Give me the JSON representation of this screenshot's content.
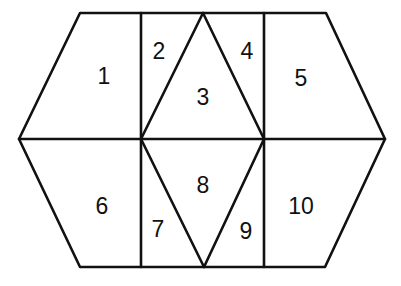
{
  "diagram": {
    "vertices": {
      "top_left": [
        80,
        13
      ],
      "top_v1": [
        141,
        13
      ],
      "top_apex": [
        203,
        13
      ],
      "top_v2": [
        264,
        13
      ],
      "top_right": [
        326,
        13
      ],
      "left": [
        19,
        139
      ],
      "mid_v1": [
        141,
        139
      ],
      "mid_v2": [
        264,
        139
      ],
      "right": [
        385,
        139
      ],
      "bottom_left": [
        80,
        267
      ],
      "bottom_v1": [
        141,
        267
      ],
      "bottom_apex": [
        204,
        267
      ],
      "bottom_v2": [
        264,
        267
      ],
      "bottom_right": [
        325,
        267
      ]
    },
    "regions": [
      {
        "label": "1",
        "x": 104,
        "y": 76
      },
      {
        "label": "2",
        "x": 159,
        "y": 51
      },
      {
        "label": "3",
        "x": 203,
        "y": 97
      },
      {
        "label": "4",
        "x": 247,
        "y": 51
      },
      {
        "label": "5",
        "x": 301,
        "y": 78
      },
      {
        "label": "6",
        "x": 102,
        "y": 206
      },
      {
        "label": "7",
        "x": 158,
        "y": 229
      },
      {
        "label": "8",
        "x": 203,
        "y": 185
      },
      {
        "label": "9",
        "x": 246,
        "y": 231
      },
      {
        "label": "10",
        "x": 301,
        "y": 206
      }
    ],
    "stroke_color": "#111111",
    "background": "#ffffff"
  }
}
